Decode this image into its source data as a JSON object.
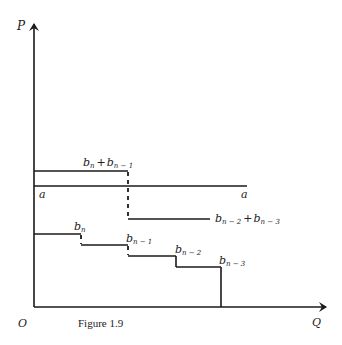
{
  "figure": {
    "caption": "Figure 1.9",
    "axes": {
      "y_label": "P",
      "x_label": "Q",
      "origin_label": "O"
    },
    "curves": {
      "upper_step": {
        "left_label": "b_n + b_{n-1}",
        "right_label": "b_{n-2} + b_{n-3}"
      },
      "line_a": {
        "left_label": "a",
        "right_label": "a"
      },
      "lower_staircase": {
        "step_labels": [
          "b_n",
          "b_{n-1}",
          "b_{n-2}",
          "b_{n-3}"
        ]
      }
    },
    "labels": {
      "P": "P",
      "Q": "Q",
      "O": "O",
      "a_left": "a",
      "a_right": "a",
      "b": "b",
      "plus": "+",
      "sub_n": "n",
      "sub_n1": "n − 1",
      "sub_n2": "n − 2",
      "sub_n3": "n − 3"
    }
  }
}
